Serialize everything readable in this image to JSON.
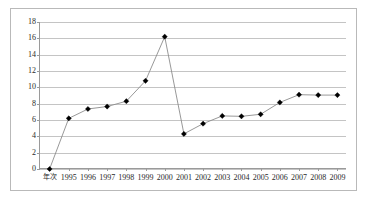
{
  "chart_data": {
    "type": "line",
    "title": "",
    "subtitle": "",
    "xlabel": "",
    "ylabel": "",
    "categories": [
      "年次",
      "1995",
      "1996",
      "1997",
      "1998",
      "1999",
      "2000",
      "2001",
      "2002",
      "2003",
      "2004",
      "2005",
      "2006",
      "2007",
      "2008",
      "2009"
    ],
    "values": [
      0,
      6.2,
      7.35,
      7.65,
      8.3,
      10.8,
      16.2,
      4.3,
      5.55,
      6.5,
      6.45,
      6.7,
      8.15,
      9.1,
      9.05,
      9.05
    ],
    "ylim": [
      0,
      18
    ],
    "ytick_step": 2,
    "yticks": [
      0,
      2,
      4,
      6,
      8,
      10,
      12,
      14,
      16,
      18
    ],
    "ytick_labels": [
      "0",
      "2",
      "4",
      "6",
      "8",
      "10",
      "12",
      "14",
      "16",
      "18"
    ],
    "grid": true,
    "grid_axis": "y",
    "legend": false,
    "legend_position": "none",
    "marker": "diamond",
    "marker_color": "#000000",
    "line_color": "#8c8c8c",
    "grid_color": "#c4c4c4",
    "axis_color": "#9a9a9a",
    "plot_background": "#ffffff",
    "border_color": "#b9b9b9",
    "annotations": []
  }
}
